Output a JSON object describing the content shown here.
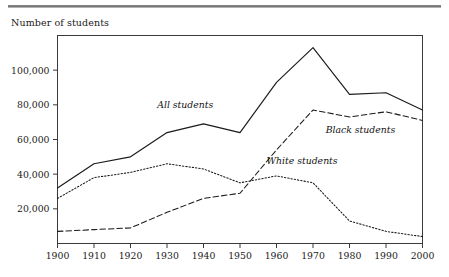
{
  "page": {
    "background_color": "#ffffff",
    "rule_color": "#7a7a7a"
  },
  "header": {
    "axis_title": "Number of students"
  },
  "chart_data": {
    "type": "line",
    "title": "",
    "subtitle": "",
    "xlabel": "",
    "ylabel": "Number of students",
    "grid": false,
    "legend_position": "inline-annotations",
    "x": [
      1900,
      1910,
      1920,
      1930,
      1940,
      1950,
      1960,
      1970,
      1980,
      1990,
      2000
    ],
    "categories": [
      "1900",
      "1910",
      "1920",
      "1930",
      "1940",
      "1950",
      "1960",
      "1970",
      "1980",
      "1990",
      "2000"
    ],
    "xlim": [
      1900,
      2000
    ],
    "ylim": [
      0,
      120000
    ],
    "ytick_values": [
      20000,
      40000,
      60000,
      80000,
      100000
    ],
    "ytick_labels": [
      "20,000",
      "40,000",
      "60,000",
      "80,000",
      "100,000"
    ],
    "series": [
      {
        "name": "All students",
        "style": "solid",
        "color": "#1a1a1a",
        "label_x": 1935,
        "label_y": 78000,
        "values": [
          32000,
          46000,
          50000,
          64000,
          69000,
          64000,
          93000,
          113000,
          86000,
          87000,
          77000
        ]
      },
      {
        "name": "Black students",
        "style": "dashed",
        "color": "#1a1a1a",
        "label_x": 1983,
        "label_y": 64000,
        "values": [
          7000,
          8000,
          9000,
          18000,
          26000,
          29000,
          54000,
          77000,
          73000,
          76000,
          71000
        ]
      },
      {
        "name": "White students",
        "style": "dotted",
        "color": "#1a1a1a",
        "label_x": 1967,
        "label_y": 46000,
        "values": [
          26000,
          38000,
          41000,
          46000,
          43000,
          35000,
          39000,
          35000,
          13000,
          7000,
          4000
        ]
      }
    ]
  }
}
